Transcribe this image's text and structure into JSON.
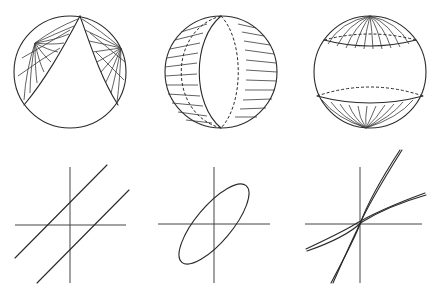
{
  "figure": {
    "background": "#ffffff",
    "stroke_color": "#2a2a2a",
    "panels_top": [
      {
        "id": "sphere-parabolic",
        "type": "sphere",
        "feature": "two lens regions meeting at a top point, hatched with lines radiating from two poles"
      },
      {
        "id": "sphere-elliptic",
        "type": "sphere",
        "feature": "central lune, hatched with horizontal lines on both sides, dashed hidden meridian"
      },
      {
        "id": "sphere-hyperbolic",
        "type": "sphere",
        "feature": "two polar caps with meridian hatching, dashed hidden parallels"
      }
    ],
    "panels_bottom": [
      {
        "id": "conic-parallel-lines",
        "type": "plot",
        "curve": "two parallel lines"
      },
      {
        "id": "conic-ellipse",
        "type": "plot",
        "curve": "tilted ellipse"
      },
      {
        "id": "conic-hyperbola",
        "type": "plot",
        "curve": "hyperbola with asymptote-like doubled strokes"
      }
    ]
  }
}
